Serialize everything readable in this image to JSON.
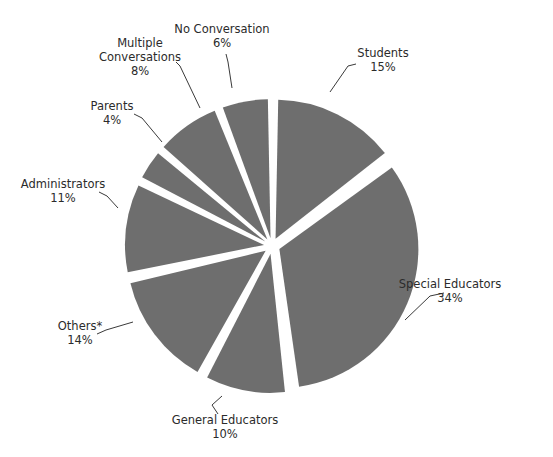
{
  "chart_data": {
    "type": "pie",
    "title": "",
    "subtitle": "",
    "xlabel": "",
    "ylabel": "",
    "legend_position": "none",
    "grid": false,
    "exploded": true,
    "units": "percent",
    "slice_color": "#6e6e6e",
    "background_color": "#ffffff",
    "categories": [
      "Students",
      "Special Educators",
      "General Educators",
      "Others*",
      "Administrators",
      "Parents",
      "Multiple Conversations",
      "No Conversation"
    ],
    "values": [
      15,
      34,
      10,
      14,
      11,
      4,
      8,
      6
    ],
    "slices": [
      {
        "label": "Students",
        "value": 15,
        "percent_text": "15%",
        "label_lines": [
          "Students"
        ],
        "label_x": 383,
        "label_y": 57,
        "pct_x": 383,
        "pct_y": 71,
        "leader": "M 356 64 L 348 66 L 330 92"
      },
      {
        "label": "Special Educators",
        "value": 34,
        "percent_text": "34%",
        "label_lines": [
          "Special Educators"
        ],
        "label_x": 450,
        "label_y": 288,
        "pct_x": 450,
        "pct_y": 302,
        "leader": "M 444 293 L 430 296 L 405 320"
      },
      {
        "label": "General Educators",
        "value": 10,
        "percent_text": "10%",
        "label_lines": [
          "General Educators"
        ],
        "label_x": 225,
        "label_y": 424,
        "pct_x": 225,
        "pct_y": 438,
        "leader": "M 218 414 L 212 405 L 222 396"
      },
      {
        "label": "Others*",
        "value": 14,
        "percent_text": "14%",
        "label_lines": [
          "Others*"
        ],
        "label_x": 80,
        "label_y": 330,
        "pct_x": 80,
        "pct_y": 344,
        "leader": "M 97 334 L 106 330 L 133 322"
      },
      {
        "label": "Administrators",
        "value": 11,
        "percent_text": "11%",
        "label_lines": [
          "Administrators"
        ],
        "label_x": 63,
        "label_y": 188,
        "pct_x": 63,
        "pct_y": 202,
        "leader": "M 99 192 L 107 196 L 118 208"
      },
      {
        "label": "Parents",
        "value": 4,
        "percent_text": "4%",
        "label_lines": [
          "Parents"
        ],
        "label_x": 112,
        "label_y": 110,
        "pct_x": 112,
        "pct_y": 124,
        "leader": "M 134 114 L 142 118 L 162 142"
      },
      {
        "label": "Multiple Conversations",
        "value": 8,
        "percent_text": "8%",
        "label_lines": [
          "Multiple",
          "Conversations"
        ],
        "label_x": 140,
        "label_y": 47,
        "pct_x": 140,
        "pct_y": 75,
        "leader": "M 176 62 L 180 66 L 200 108"
      },
      {
        "label": "No Conversation",
        "value": 6,
        "percent_text": "6%",
        "label_lines": [
          "No Conversation"
        ],
        "label_x": 222,
        "label_y": 33,
        "pct_x": 222,
        "pct_y": 47,
        "leader": "M 226 54 L 228 62 L 232 88"
      }
    ],
    "footnote": ""
  }
}
